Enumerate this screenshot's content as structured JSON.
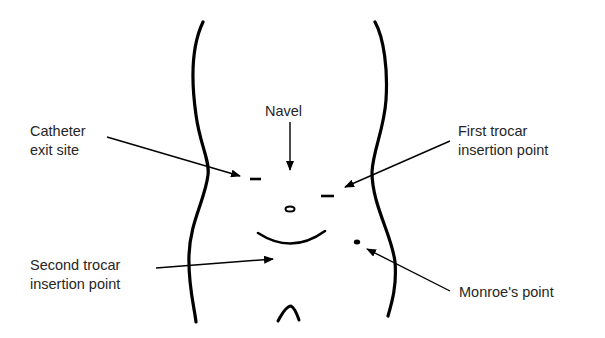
{
  "figure": {
    "type": "anatomical-diagram",
    "stroke_color": "#000000",
    "text_color": "#262626",
    "background": "#ffffff"
  },
  "labels": {
    "navel": {
      "lines": [
        "Navel"
      ]
    },
    "catheter_exit_site": {
      "lines": [
        "Catheter",
        "exit site"
      ]
    },
    "first_trocar": {
      "lines": [
        "First trocar",
        "insertion point"
      ]
    },
    "second_trocar": {
      "lines": [
        "Second trocar",
        "insertion point"
      ]
    },
    "monroes_point": {
      "lines": [
        "Monroe's point"
      ]
    }
  },
  "marks": [
    {
      "name": "catheter-exit-mark",
      "shape": "dash"
    },
    {
      "name": "first-trocar-mark",
      "shape": "dash"
    },
    {
      "name": "navel-mark",
      "shape": "oval"
    },
    {
      "name": "incision-curve",
      "shape": "arc"
    },
    {
      "name": "monroes-point-mark",
      "shape": "dot"
    },
    {
      "name": "groin-mark",
      "shape": "caret"
    }
  ],
  "arrows": [
    {
      "from": "Navel",
      "to": "navel-area"
    },
    {
      "from": "Catheter exit site",
      "to": "catheter-exit-mark"
    },
    {
      "from": "First trocar insertion point",
      "to": "first-trocar-mark"
    },
    {
      "from": "Second trocar insertion point",
      "to": "incision-curve"
    },
    {
      "from": "Monroe's point",
      "to": "monroes-point-mark"
    }
  ]
}
